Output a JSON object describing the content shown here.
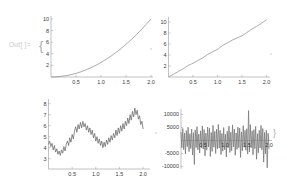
{
  "out_label": "Out[ ]=",
  "punctuation": {
    "open_brace": "{",
    "comma_1": ",",
    "comma_2": ",",
    "comma_3": ",",
    "close_brace": "}"
  },
  "colors": {
    "background": "#ffffff",
    "axis": "#999999",
    "tick_text": "#3c3c3c",
    "smooth_curve": "#979797",
    "noise_curve": "#6f6f6f",
    "out_label": "#c6c6c6"
  },
  "chart_data": [
    {
      "type": "line",
      "title": "",
      "xlabel": "",
      "ylabel": "",
      "xlim": [
        0,
        2.05
      ],
      "ylim": [
        0,
        10.5
      ],
      "xticks": [
        "0.5",
        "1.0",
        "1.5",
        "2.0"
      ],
      "xtick_values": [
        0.5,
        1.0,
        1.5,
        2.0
      ],
      "yticks": [
        "2",
        "4",
        "6",
        "8",
        "10"
      ],
      "ytick_values": [
        2,
        4,
        6,
        8,
        10
      ],
      "grid": false,
      "legend": "none",
      "x_start": 0,
      "x_end": 2,
      "line_color": "#979797",
      "values": [
        0,
        0.03,
        0.1,
        0.23,
        0.4,
        0.63,
        0.9,
        1.23,
        1.6,
        2.03,
        2.5,
        3.03,
        3.6,
        4.23,
        4.9,
        5.63,
        6.4,
        7.23,
        8.1,
        9.03,
        10.0
      ]
    },
    {
      "type": "line",
      "title": "",
      "xlabel": "",
      "ylabel": "",
      "xlim": [
        0,
        2.05
      ],
      "ylim": [
        0,
        10.8
      ],
      "xticks": [
        "0.5",
        "1.0",
        "1.5",
        "2.0"
      ],
      "xtick_values": [
        0.5,
        1.0,
        1.5,
        2.0
      ],
      "yticks": [
        "2",
        "4",
        "6",
        "8",
        "10"
      ],
      "ytick_values": [
        2,
        4,
        6,
        8,
        10
      ],
      "grid": false,
      "legend": "none",
      "x_start": 0,
      "x_end": 2,
      "line_color": "#979797",
      "values": [
        0,
        0.5,
        1.0,
        1.5,
        2.1,
        2.5,
        3.0,
        3.5,
        4.1,
        4.6,
        5.0,
        5.7,
        6.2,
        6.7,
        7.1,
        7.5,
        8.1,
        8.7,
        9.2,
        9.8,
        10.4
      ]
    },
    {
      "type": "line",
      "title": "",
      "xlabel": "",
      "ylabel": "",
      "xlim": [
        0,
        2.05
      ],
      "ylim": [
        2.6,
        8.3
      ],
      "xticks": [
        "0.5",
        "1.0",
        "1.5",
        "2.0"
      ],
      "xtick_values": [
        0.5,
        1.0,
        1.5,
        2.0
      ],
      "yticks": [
        "3",
        "4",
        "5",
        "6",
        "7",
        "8"
      ],
      "ytick_values": [
        3,
        4,
        5,
        6,
        7,
        8
      ],
      "grid": false,
      "legend": "none",
      "x_start": 0,
      "x_end": 2,
      "line_color": "#6f6f6f",
      "values": [
        4.3,
        4.6,
        4.1,
        4.4,
        3.8,
        4.2,
        3.6,
        3.9,
        3.4,
        3.7,
        3.3,
        3.8,
        3.5,
        4.1,
        3.7,
        4.3,
        4.6,
        4.2,
        4.9,
        4.5,
        5.2,
        4.8,
        5.5,
        5.9,
        5.4,
        6.1,
        5.7,
        6.3,
        5.8,
        6.4,
        5.9,
        6.2,
        5.6,
        6.0,
        5.4,
        5.8,
        5.2,
        5.6,
        4.9,
        5.3,
        4.6,
        5.0,
        4.4,
        4.8,
        4.2,
        4.6,
        4.0,
        4.5,
        4.1,
        4.7,
        4.3,
        4.9,
        4.5,
        5.1,
        4.7,
        5.3,
        4.9,
        5.6,
        5.1,
        5.8,
        5.3,
        6.0,
        5.5,
        6.2,
        5.7,
        6.4,
        6.0,
        6.7,
        6.2,
        7.0,
        6.5,
        7.3,
        6.8,
        7.6,
        7.0,
        7.4,
        6.6,
        6.9,
        6.1,
        6.4,
        5.7
      ]
    },
    {
      "type": "line",
      "title": "",
      "xlabel": "",
      "ylabel": "",
      "xlim": [
        0,
        2.05
      ],
      "ylim": [
        -11500,
        12500
      ],
      "xticks": [
        "0.5",
        "1.0",
        "1.5",
        "2.0"
      ],
      "xtick_values": [
        0.5,
        1.0,
        1.5,
        2.0
      ],
      "yticks": [
        "10000",
        "5000",
        "-5000",
        "-10000"
      ],
      "ytick_values": [
        10000,
        5000,
        -5000,
        -10000
      ],
      "grid": false,
      "legend": "none",
      "x_start": 0,
      "x_end": 2,
      "line_color": "#7a7a7a",
      "values": [
        3200,
        -2800,
        4600,
        -3500,
        2900,
        -5200,
        3800,
        -2400,
        5100,
        -4300,
        2600,
        -3100,
        4400,
        -5600,
        3000,
        -9200,
        4100,
        -2700,
        5300,
        -3600,
        2500,
        -4800,
        3700,
        -2900,
        5600,
        -3300,
        4200,
        -5900,
        2800,
        -3700,
        5200,
        -2500,
        4700,
        -6100,
        3100,
        -4200,
        5800,
        -2600,
        3500,
        -5000,
        4300,
        -3200,
        6200,
        -2900,
        3900,
        -5400,
        2700,
        -4100,
        5000,
        -3500,
        2400,
        -6300,
        3600,
        -2800,
        5500,
        -4600,
        3200,
        -3900,
        6000,
        -2500,
        4400,
        -5700,
        2900,
        -3400,
        5100,
        -2700,
        4800,
        -6500,
        3300,
        -4000,
        5700,
        -2600,
        3900,
        -3800,
        4500,
        -5200,
        11500,
        -4400,
        6100,
        -2800,
        3700,
        -5500,
        4200,
        -3100,
        5400,
        -7200,
        2600,
        -4700,
        3900,
        -2900,
        5800,
        -3600,
        4600,
        -8300,
        3100,
        -5100,
        4000,
        -10500,
        2800,
        -3300
      ]
    }
  ]
}
